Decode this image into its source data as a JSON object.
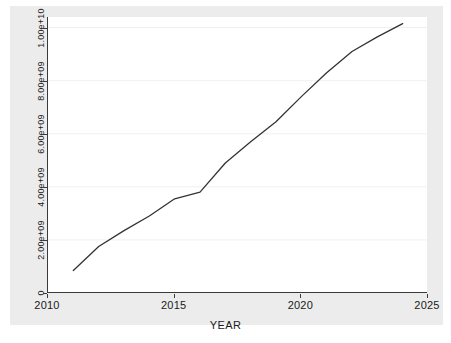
{
  "chart_data": {
    "type": "line",
    "title": "",
    "subtitle": "",
    "xlabel": "YEAR",
    "ylabel": "Infrastructure Shortfall (Running Total)",
    "xlim": [
      2010,
      2025
    ],
    "ylim": [
      0,
      10400000000
    ],
    "x_ticks": [
      "2010",
      "2015",
      "2020",
      "2025"
    ],
    "x_tick_values": [
      2010,
      2015,
      2020,
      2025
    ],
    "y_ticks": [
      "0",
      "2.00e+09",
      "4.00e+09",
      "6.00e+09",
      "8.00e+09",
      "1.00e+10"
    ],
    "y_tick_values": [
      0,
      2000000000,
      4000000000,
      6000000000,
      8000000000,
      10000000000
    ],
    "grid": "horizontal",
    "legend": "none",
    "line_color": "#333333",
    "series": [
      {
        "name": "Infrastructure Shortfall (Running Total)",
        "x": [
          2011,
          2012,
          2013,
          2014,
          2015,
          2016,
          2017,
          2018,
          2019,
          2020,
          2021,
          2022,
          2023,
          2024
        ],
        "values": [
          850000000,
          1750000000,
          2350000000,
          2900000000,
          3550000000,
          3800000000,
          4900000000,
          5700000000,
          6450000000,
          7400000000,
          8300000000,
          9100000000,
          9650000000,
          10150000000
        ]
      }
    ]
  },
  "figure": {
    "background_color": "#ececec",
    "plot_background_color": "#ffffff",
    "axis_color": "#3a3a3a",
    "grid_color": "#f0f0f0"
  }
}
